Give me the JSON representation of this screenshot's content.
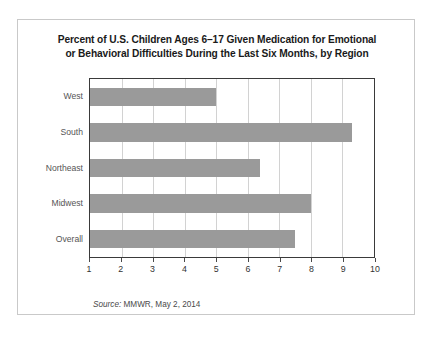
{
  "chart_data": {
    "type": "bar",
    "orientation": "horizontal",
    "title": "Percent of U.S. Children Ages 6–17 Given Medication for Emotional or Behavioral Difficulties During the Last Six Months, by Region",
    "title_lines": [
      "Percent of U.S. Children Ages 6–17 Given Medication for Emotional",
      "or Behavioral Difficulties During the Last Six Months, by Region"
    ],
    "categories": [
      "West",
      "South",
      "Northeast",
      "Midwest",
      "Overall"
    ],
    "values": [
      5.0,
      9.3,
      6.4,
      8.0,
      7.5
    ],
    "xlabel": "",
    "ylabel": "",
    "xlim": [
      1,
      10
    ],
    "xticks": [
      1,
      2,
      3,
      4,
      5,
      6,
      7,
      8,
      9,
      10
    ],
    "xtick_labels": [
      "1",
      "2",
      "3",
      "4",
      "5",
      "6",
      "7",
      "8",
      "9",
      "10"
    ],
    "grid": "vertical",
    "legend": false,
    "bar_color": "#9a9a9a",
    "gridline_color": "#d2d2d2",
    "axis_color": "#3a3a3a",
    "source_prefix": "Source:",
    "source_text": "MMWR, May 2, 2014"
  }
}
